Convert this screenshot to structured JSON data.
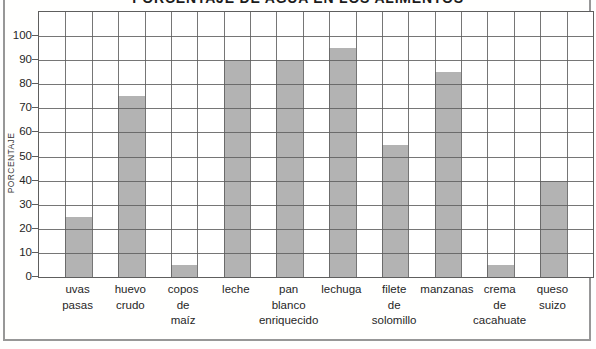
{
  "chart_data": {
    "type": "bar",
    "title": "PORCENTAJE DE AGUA EN LOS ALIMENTOS",
    "xlabel": "",
    "ylabel": "PORCENTAJE",
    "categories": [
      "uvas pasas",
      "huevo crudo",
      "copos de maíz",
      "leche",
      "pan blanco enriquecido",
      "lechuga",
      "filete de solomillo",
      "manzanas",
      "crema de cacahuate",
      "queso suizo"
    ],
    "category_lines": [
      [
        "uvas",
        "pasas"
      ],
      [
        "huevo",
        "crudo"
      ],
      [
        "copos",
        "de",
        "maíz"
      ],
      [
        "leche"
      ],
      [
        "pan",
        "blanco",
        "enriquecido"
      ],
      [
        "lechuga"
      ],
      [
        "filete",
        "de",
        "solomillo"
      ],
      [
        "manzanas"
      ],
      [
        "crema",
        "de",
        "cacahuate"
      ],
      [
        "queso",
        "suizo"
      ]
    ],
    "values": [
      25,
      75,
      5,
      90,
      90,
      95,
      55,
      85,
      5,
      40
    ],
    "y_ticks": [
      0,
      10,
      20,
      30,
      40,
      50,
      60,
      70,
      80,
      90,
      100
    ],
    "ylim": [
      0,
      110
    ],
    "grid": true,
    "legend": false,
    "colors": {
      "bar": "#b3b3b3",
      "grid": "#5e5e5e",
      "text": "#262626",
      "frame": "#979797",
      "background": "#ffffff"
    }
  }
}
